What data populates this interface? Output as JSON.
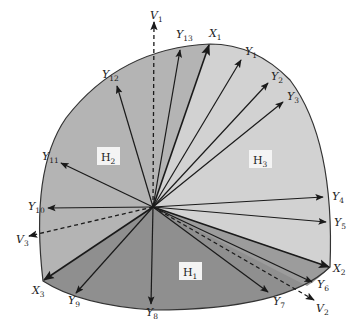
{
  "figure": {
    "type": "vector-cone-diagram",
    "colors": {
      "H1": "#8f8f8f",
      "H2": "#b4b4b4",
      "H3": "#d2d2d2",
      "outline": "#333333",
      "vector": "#1a1a1a"
    },
    "regions": [
      {
        "id": "H1",
        "label": "H",
        "sub": "1"
      },
      {
        "id": "H2",
        "label": "H",
        "sub": "2"
      },
      {
        "id": "H3",
        "label": "H",
        "sub": "3"
      }
    ],
    "extreme_vectors": [
      {
        "id": "X1",
        "label": "X",
        "sub": "1"
      },
      {
        "id": "X2",
        "label": "X",
        "sub": "2"
      },
      {
        "id": "X3",
        "label": "X",
        "sub": "3"
      }
    ],
    "dashed_vectors": [
      {
        "id": "V1",
        "label": "V",
        "sub": "1"
      },
      {
        "id": "V2",
        "label": "V",
        "sub": "2"
      },
      {
        "id": "V3",
        "label": "V",
        "sub": "3"
      }
    ],
    "y_vectors": [
      {
        "id": "Y1",
        "label": "Y",
        "sub": "1"
      },
      {
        "id": "Y2",
        "label": "Y",
        "sub": "2"
      },
      {
        "id": "Y3",
        "label": "Y",
        "sub": "3"
      },
      {
        "id": "Y4",
        "label": "Y",
        "sub": "4"
      },
      {
        "id": "Y5",
        "label": "Y",
        "sub": "5"
      },
      {
        "id": "Y6",
        "label": "Y",
        "sub": "6"
      },
      {
        "id": "Y7",
        "label": "Y",
        "sub": "7"
      },
      {
        "id": "Y8",
        "label": "Y",
        "sub": "8"
      },
      {
        "id": "Y9",
        "label": "Y",
        "sub": "9"
      },
      {
        "id": "Y10",
        "label": "Y",
        "sub": "10"
      },
      {
        "id": "Y11",
        "label": "Y",
        "sub": "11"
      },
      {
        "id": "Y12",
        "label": "Y",
        "sub": "12"
      },
      {
        "id": "Y13",
        "label": "Y",
        "sub": "13"
      }
    ]
  }
}
